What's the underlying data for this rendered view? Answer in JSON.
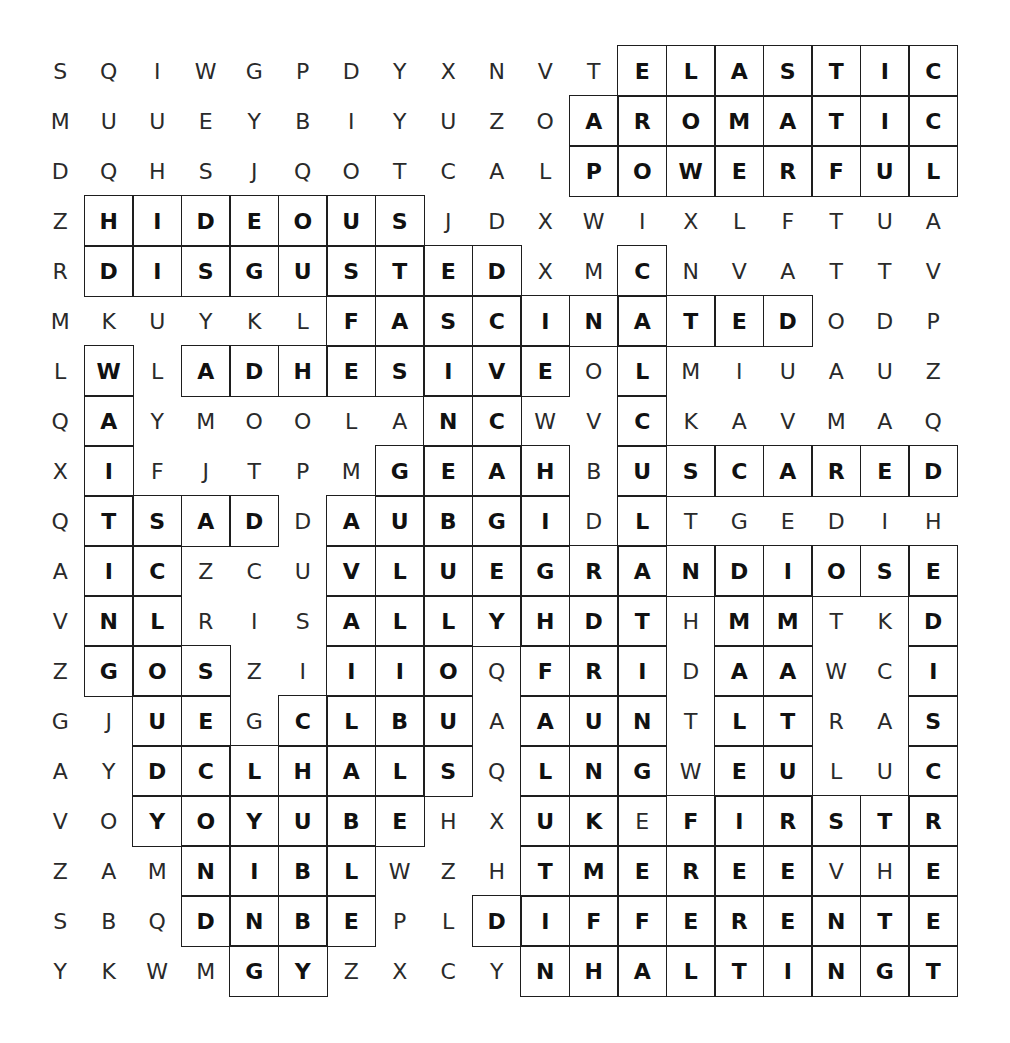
{
  "puzzle": {
    "rows": [
      "SQIWGPDYXNVTELASTIC",
      "MUUEYBIYUZOAROMATIC",
      "DQHSJQOTCALPOWERFUL",
      "ZHIDEOUSJDXWIXLFTUA",
      "RDISGUSTEDXMCNVATTV",
      "MKUYKLFASCINATEDODP",
      "LWLADHESIVEOLMIUAUZ",
      "QAYMOOLANCWVCKAVMAQ",
      "XIFJTPMGEAHBUSCARED",
      "QTSADDAUBGIDLTGEDIH",
      "AICZCUVLUEGRANDIOSE",
      "VNLRISALLYHDTHMMTKD",
      "ZGOSZIIIOQFRIDAAWCI",
      "GJUEGCLBUAAUNTLTRAS",
      "AYDCLHALSQLNGWEULUC",
      "VOYOYUBEHXUKEFIRSTR",
      "ZAMNIBLWZHTMEREEVHE",
      "SBQDNBEPLDIFFERENTE",
      "YKWMGYZXCYNHALTINGT"
    ],
    "boxed": [
      "0000000000001111111",
      "0000000000011111111",
      "0000000000011111111",
      "0111111100000000000",
      "0111111111001000000",
      "0000001111111111000",
      "0101111111101000000",
      "0100000011001000000",
      "0100000111101111111",
      "0111101111101000000",
      "0110001111111111111",
      "0110001111111011001",
      "0111001110111011001",
      "0011011110111011001",
      "0011111110111011001",
      "0011111100111111111",
      "0001111000111111111",
      "0001111001111111111",
      "0000110000111111111"
    ],
    "bold": [
      "0000000000001111111",
      "0000000000011111111",
      "0000000000011111111",
      "0111111100000000000",
      "0111111111001000000",
      "0000001111111111000",
      "0101111111101000000",
      "0100000011001000000",
      "0100000111101111111",
      "0111101111101000000",
      "0110001111111111111",
      "0110001111111011001",
      "0111001110111011001",
      "0011011110111011001",
      "0011111110111011001",
      "0011111100110111111",
      "0001111000111111001",
      "0001111001111111111",
      "0000110000111111111"
    ],
    "found_words": [
      "ELASTIC",
      "AROMATIC",
      "POWERFUL",
      "HIDEOUS",
      "DISGUSTED",
      "FASCINATED",
      "ADHESIVE",
      "SCARED",
      "SAD",
      "GRANDIOSE",
      "DIFFERENT",
      "HALTING",
      "WAITING",
      "FIRST"
    ]
  }
}
